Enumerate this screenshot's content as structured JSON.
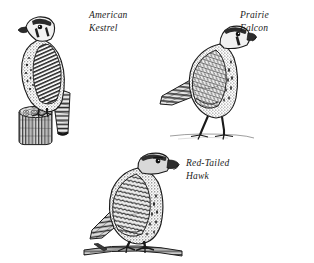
{
  "plate": {
    "background_color": "#ffffff",
    "ink_color": "#1b1b1b",
    "width": 314,
    "height": 263,
    "style": "engraving"
  },
  "figures": [
    {
      "id": "american-kestrel",
      "caption_lines": [
        "American",
        "Kestrel"
      ],
      "full_name": "American Kestrel",
      "pose": "perched on cut tree stump, facing left",
      "perch": "tree stump"
    },
    {
      "id": "prairie-falcon",
      "caption_lines": [
        "Prairie",
        "Falcon"
      ],
      "full_name": "Prairie Falcon",
      "pose": "standing on ground, facing right",
      "perch": "ground"
    },
    {
      "id": "red-tailed-hawk",
      "caption_lines": [
        "Red-Tailed",
        "Hawk"
      ],
      "full_name": "Red-Tailed Hawk",
      "pose": "perched on horizontal branch, facing right",
      "perch": "branch"
    }
  ]
}
